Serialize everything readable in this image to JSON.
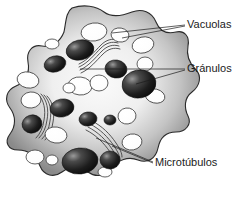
{
  "figure": {
    "background_color": "#ffffff",
    "language": "es"
  },
  "labels": [
    {
      "id": "vacuolas",
      "text": "Vacuolas",
      "x": 187,
      "y": 25,
      "color": "#1b1b1b",
      "leaders": [
        {
          "x1": 185,
          "y1": 25,
          "x2": 112,
          "y2": 33
        },
        {
          "x1": 185,
          "y1": 26,
          "x2": 122,
          "y2": 38
        }
      ]
    },
    {
      "id": "granulos",
      "text": "Gránulos",
      "x": 187,
      "y": 69,
      "color": "#1b1b1b",
      "leaders": [
        {
          "x1": 185,
          "y1": 69,
          "x2": 80,
          "y2": 69
        },
        {
          "x1": 185,
          "y1": 70,
          "x2": 136,
          "y2": 84
        }
      ]
    },
    {
      "id": "microtubulos",
      "text": "Microtúbulos",
      "x": 155,
      "y": 163,
      "color": "#1b1b1b",
      "leaders": [
        {
          "x1": 153,
          "y1": 162,
          "x2": 96,
          "y2": 138
        },
        {
          "x1": 153,
          "y1": 163,
          "x2": 112,
          "y2": 146
        }
      ]
    }
  ],
  "cell": {
    "outline_color": "#2b2b2b",
    "cortex_color": "#8d8d8d",
    "cytosol_color": "#f2f2f2",
    "stipple_color": "#2e2e2e",
    "outline_path": "M 72 8 C 84 4 96 6 104 12 C 112 18 122 16 132 12 C 142 8 152 12 156 22 C 160 32 168 34 176 32 C 184 30 190 36 188 46 C 186 56 190 64 196 70 C 202 76 200 86 192 92 C 184 98 184 108 188 116 C 192 124 186 132 176 132 C 166 132 160 138 158 148 C 156 158 148 164 138 160 C 128 156 118 160 112 168 C 106 176 96 178 88 172 C 80 166 70 166 62 172 C 54 178 44 176 40 166 C 36 156 28 150 18 150 C 8 150 4 142 10 134 C 16 126 16 116 10 108 C 4 100 6 90 16 86 C 26 82 30 72 28 62 C 26 52 32 44 42 46 C 52 48 60 42 64 32 C 66 22 66 12 72 8 Z"
  },
  "vacuoles": [
    {
      "cx": 94,
      "cy": 32,
      "rx": 13,
      "ry": 9,
      "rot": -8
    },
    {
      "cx": 120,
      "cy": 35,
      "rx": 9,
      "ry": 7,
      "rot": 10
    },
    {
      "cx": 143,
      "cy": 45,
      "rx": 11,
      "ry": 8,
      "rot": -14
    },
    {
      "cx": 145,
      "cy": 64,
      "rx": 8,
      "ry": 7,
      "rot": 0
    },
    {
      "cx": 52,
      "cy": 44,
      "rx": 7,
      "ry": 5,
      "rot": 0
    },
    {
      "cx": 28,
      "cy": 80,
      "rx": 11,
      "ry": 8,
      "rot": 12
    },
    {
      "cx": 31,
      "cy": 100,
      "rx": 10,
      "ry": 8,
      "rot": -6
    },
    {
      "cx": 80,
      "cy": 86,
      "rx": 12,
      "ry": 9,
      "rot": 6
    },
    {
      "cx": 99,
      "cy": 83,
      "rx": 9,
      "ry": 8,
      "rot": 0
    },
    {
      "cx": 69,
      "cy": 88,
      "rx": 6,
      "ry": 5,
      "rot": 0
    },
    {
      "cx": 155,
      "cy": 96,
      "rx": 10,
      "ry": 7,
      "rot": 14
    },
    {
      "cx": 127,
      "cy": 116,
      "rx": 9,
      "ry": 8,
      "rot": -8
    },
    {
      "cx": 56,
      "cy": 135,
      "rx": 11,
      "ry": 8,
      "rot": 8
    },
    {
      "cx": 132,
      "cy": 142,
      "rx": 10,
      "ry": 8,
      "rot": -10
    },
    {
      "cx": 35,
      "cy": 157,
      "rx": 9,
      "ry": 7,
      "rot": 0
    },
    {
      "cx": 52,
      "cy": 160,
      "rx": 6,
      "ry": 5,
      "rot": 0
    },
    {
      "cx": 105,
      "cy": 172,
      "rx": 7,
      "ry": 5,
      "rot": 0
    },
    {
      "cx": 84,
      "cy": 52,
      "rx": 7,
      "ry": 5,
      "rot": 0
    }
  ],
  "granules": [
    {
      "cx": 80,
      "cy": 50,
      "rx": 14,
      "ry": 10,
      "rot": -12
    },
    {
      "cx": 55,
      "cy": 64,
      "rx": 11,
      "ry": 8,
      "rot": -14
    },
    {
      "cx": 116,
      "cy": 69,
      "rx": 11,
      "ry": 9,
      "rot": 8
    },
    {
      "cx": 139,
      "cy": 84,
      "rx": 17,
      "ry": 14,
      "rot": -10
    },
    {
      "cx": 62,
      "cy": 108,
      "rx": 12,
      "ry": 9,
      "rot": -10
    },
    {
      "cx": 32,
      "cy": 124,
      "rx": 10,
      "ry": 9,
      "rot": -18
    },
    {
      "cx": 88,
      "cy": 119,
      "rx": 9,
      "ry": 7,
      "rot": -8
    },
    {
      "cx": 110,
      "cy": 120,
      "rx": 6,
      "ry": 5,
      "rot": 0
    },
    {
      "cx": 80,
      "cy": 161,
      "rx": 18,
      "ry": 13,
      "rot": -6
    },
    {
      "cx": 110,
      "cy": 160,
      "rx": 10,
      "ry": 9,
      "rot": 0
    }
  ],
  "microtubule_bundles": [
    {
      "id": "bundle-top",
      "strands": [
        "M 79 64 C 88 60 94 52 101 45 C 106 40 112 38 118 40",
        "M 79 67 C 88 63 94 55 101 48 C 106 43 112 41 118 43",
        "M 80 70 C 89 66 95 58 102 51 C 107 46 113 44 119 46",
        "M 81 73 C 90 69 96 61 103 54 C 108 49 114 47 120 49"
      ]
    },
    {
      "id": "bundle-left",
      "strands": [
        "M 38 94 C 44 100 46 110 44 120 C 43 128 40 134 36 138",
        "M 41 94 C 47 100 49 110 47 120 C 46 128 43 134 39 138",
        "M 44 95 C 50 101 52 111 50 121 C 49 129 46 135 42 139",
        "M 47 96 C 53 102 55 112 53 122 C 52 130 49 136 45 140"
      ]
    },
    {
      "id": "bundle-bottom",
      "strands": [
        "M 92 121 C 102 126 110 134 116 143 C 120 149 122 153 122 157",
        "M 90 124 C 100 129 108 137 114 146 C 118 152 120 156 120 160",
        "M 88 127 C 98 132 106 140 112 149 C 116 155 118 159 118 163",
        "M 86 130 C 96 135 104 143 110 152 C 114 158 116 162 116 166"
      ]
    }
  ]
}
